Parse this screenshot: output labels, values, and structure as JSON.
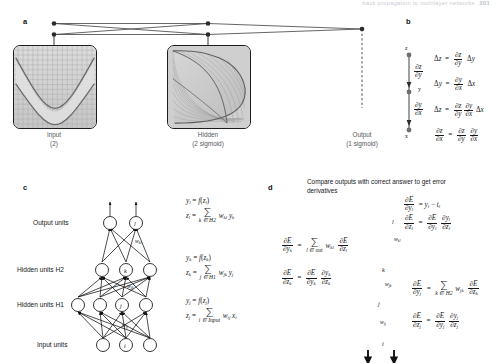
{
  "runhead": {
    "text": "back propagation to multilayer networks",
    "page": "201"
  },
  "panels": {
    "a": {
      "letter": "a",
      "boxes": [
        {
          "name": "input",
          "title": "Input",
          "subtitle": "(2)"
        },
        {
          "name": "hidden",
          "title": "Hidden",
          "subtitle": "(2 sigmoid)"
        },
        {
          "name": "output",
          "title": "Output",
          "subtitle": "(1 sigmoid)"
        }
      ]
    },
    "b": {
      "letter": "b",
      "nodes": [
        "z",
        "y",
        "x"
      ],
      "edge_labels": [
        "∂z/∂y",
        "∂y/∂x"
      ],
      "equations": [
        "Δz = (∂z/∂y) Δy",
        "Δy = (∂y/∂x) Δx",
        "Δz = (∂z/∂y)(∂y/∂x) Δx",
        "∂z/∂x = (∂z/∂y)(∂y/∂x)"
      ]
    },
    "c": {
      "letter": "c",
      "layer_labels": [
        "Output units",
        "Hidden units H2",
        "Hidden units H1",
        "Input units"
      ],
      "unit_letters": [
        "l",
        "k",
        "j",
        "i"
      ],
      "weight_labels": [
        "w",
        "w",
        "w"
      ],
      "weight_subs": [
        "kl",
        "jk",
        "ij"
      ],
      "equations": [
        {
          "line1": "y_l = f(z_l)",
          "line2": "z_l = Σ w_kl y_k",
          "line3": "k ∈ H2"
        },
        {
          "line1": "y_k = f(z_k)",
          "line2": "z_k = Σ w_jk y_j",
          "line3": "j ∈ H1"
        },
        {
          "line1": "y_j = f(z_j)",
          "line2": "z_j = Σ w_ij x_i",
          "line3": "i ∈ Input"
        }
      ]
    },
    "d": {
      "letter": "d",
      "caption": "Compare outputs with correct answer to get error derivatives",
      "unit_letters": [
        "l",
        "k",
        "j",
        "i"
      ],
      "weight_subs": [
        "kl",
        "jk",
        "ij"
      ],
      "equations": {
        "top": [
          "∂E/∂y_l = y_l − t_l",
          "∂E/∂z_l = (∂E/∂y_l)(∂y_l/∂z_l)"
        ],
        "left": [
          "∂E/∂y_k = Σ_{l ∈ out} w_kl ∂E/∂z_l",
          "∂E/∂z_k = (∂E/∂y_k)(∂y_k/∂z_k)"
        ],
        "right": [
          "∂E/∂y_j = Σ_{k ∈ H2} w_jk ∂E/∂z_k",
          "∂E/∂z_j = (∂E/∂y_j)(∂y_j/∂z_j)"
        ]
      },
      "sum_index_out": "l ∈ out",
      "sum_index_h2": "k ∈ H2"
    }
  },
  "colors": {
    "ink": "#1a1a1a",
    "label_grey": "#55585d",
    "surface_fill": "#cfcfcf",
    "surface_line": "#8c8c8c",
    "node_stroke": "#111111",
    "runhead_grey": "#c9ccd2"
  }
}
